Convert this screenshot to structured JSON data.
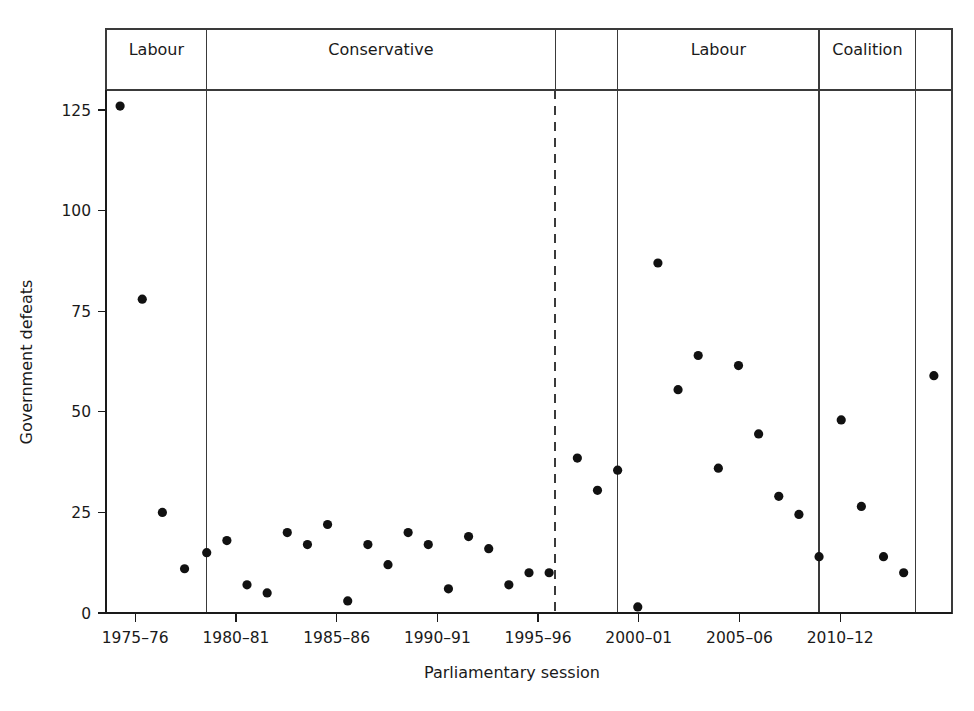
{
  "chart_data": {
    "type": "scatter",
    "title": "",
    "xlabel": "Parliamentary session",
    "ylabel": "Government defeats",
    "xlim": [
      1974.0,
      2016.0
    ],
    "ylim": [
      0,
      130
    ],
    "grid": false,
    "legend": "none",
    "y_ticks": [
      0,
      25,
      50,
      75,
      100,
      125
    ],
    "y_tick_labels": [
      "0",
      "25",
      "50",
      "75",
      "100",
      "125"
    ],
    "x_ticks": [
      1975,
      1980,
      1985,
      1990,
      1995,
      2000,
      2005,
      2010
    ],
    "x_tick_labels": [
      "1975–76",
      "1980–81",
      "1985–86",
      "1990–91",
      "1995–96",
      "2000–01",
      "2005–06",
      "2010–12"
    ],
    "point_color": "#111111",
    "point_radius": 4.6,
    "panels": [
      {
        "label": "Labour",
        "x_start": 1974.0,
        "x_end": 1979.0,
        "divider": "solid"
      },
      {
        "label": "Conservative",
        "x_start": 1979.0,
        "x_end": 1996.3,
        "divider": "solid"
      },
      {
        "label": "",
        "x_start": 1996.3,
        "x_end": 1999.4,
        "divider": "dashed"
      },
      {
        "label": "Labour",
        "x_start": 1999.4,
        "x_end": 2009.4,
        "divider": "solid"
      },
      {
        "label": "Coalition",
        "x_start": 2009.4,
        "x_end": 2014.2,
        "divider": "solid"
      },
      {
        "label": "",
        "x_start": 2014.2,
        "x_end": 2016.0,
        "divider": "none"
      }
    ],
    "series": [
      {
        "name": "Government defeats per parliamentary session",
        "points": [
          {
            "session": "1974–75",
            "x": 1974.7,
            "y": 126
          },
          {
            "session": "1975–76",
            "x": 1975.8,
            "y": 78
          },
          {
            "session": "1976–77",
            "x": 1976.8,
            "y": 25
          },
          {
            "session": "1977–78",
            "x": 1977.9,
            "y": 11
          },
          {
            "session": "1978–79",
            "x": 1979.0,
            "y": 15
          },
          {
            "session": "1979–80",
            "x": 1980.0,
            "y": 18
          },
          {
            "session": "1980–81",
            "x": 1981.0,
            "y": 7
          },
          {
            "session": "1981–82",
            "x": 1982.0,
            "y": 5
          },
          {
            "session": "1982–83",
            "x": 1983.0,
            "y": 20
          },
          {
            "session": "1983–84",
            "x": 1984.0,
            "y": 17
          },
          {
            "session": "1984–85",
            "x": 1985.0,
            "y": 22
          },
          {
            "session": "1985–86",
            "x": 1986.0,
            "y": 3
          },
          {
            "session": "1986–87",
            "x": 1987.0,
            "y": 17
          },
          {
            "session": "1987–88",
            "x": 1988.0,
            "y": 12
          },
          {
            "session": "1988–89",
            "x": 1989.0,
            "y": 20
          },
          {
            "session": "1989–90",
            "x": 1990.0,
            "y": 17
          },
          {
            "session": "1990–91",
            "x": 1991.0,
            "y": 6
          },
          {
            "session": "1991–92",
            "x": 1992.0,
            "y": 19
          },
          {
            "session": "1992–93",
            "x": 1993.0,
            "y": 16
          },
          {
            "session": "1993–94",
            "x": 1994.0,
            "y": 7
          },
          {
            "session": "1994–95",
            "x": 1995.0,
            "y": 10
          },
          {
            "session": "1995–96",
            "x": 1996.0,
            "y": 10
          },
          {
            "session": "1996–97",
            "x": 1997.4,
            "y": 38.5
          },
          {
            "session": "1997–98",
            "x": 1998.4,
            "y": 30.5
          },
          {
            "session": "1998–99",
            "x": 1999.4,
            "y": 35.5
          },
          {
            "session": "1999–2000",
            "x": 2000.4,
            "y": 1.5
          },
          {
            "session": "2000–01",
            "x": 2001.4,
            "y": 87
          },
          {
            "session": "2001–02",
            "x": 2002.4,
            "y": 55.5
          },
          {
            "session": "2002–03",
            "x": 2003.4,
            "y": 64
          },
          {
            "session": "2003–04",
            "x": 2004.4,
            "y": 36
          },
          {
            "session": "2004–05",
            "x": 2005.4,
            "y": 61.5
          },
          {
            "session": "2005–06",
            "x": 2006.4,
            "y": 44.5
          },
          {
            "session": "2006–07",
            "x": 2007.4,
            "y": 29
          },
          {
            "session": "2007–08",
            "x": 2008.4,
            "y": 24.5
          },
          {
            "session": "2008–09",
            "x": 2009.4,
            "y": 14
          },
          {
            "session": "2009–10",
            "x": 2010.5,
            "y": 48
          },
          {
            "session": "2010–12",
            "x": 2011.5,
            "y": 26.5
          },
          {
            "session": "2012–13",
            "x": 2012.6,
            "y": 14
          },
          {
            "session": "2013–14",
            "x": 2013.6,
            "y": 10
          },
          {
            "session": "2014–15",
            "x": 2015.1,
            "y": 59
          }
        ]
      }
    ]
  }
}
